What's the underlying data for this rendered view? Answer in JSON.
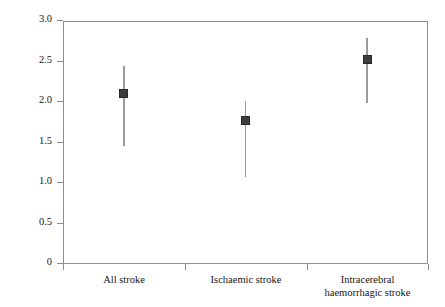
{
  "chart_data": {
    "type": "scatter",
    "title": "",
    "xlabel": "",
    "ylabel": "Odds ratio for smoking (99% CI)",
    "ylim": [
      0,
      3.0
    ],
    "yticks": [
      "0",
      "0.5",
      "1.0",
      "1.5",
      "2.0",
      "2.5",
      "3.0"
    ],
    "ytick_values": [
      0,
      0.5,
      1.0,
      1.5,
      2.0,
      2.5,
      3.0
    ],
    "grid": false,
    "legend": "none",
    "categories": [
      "All stroke",
      "Ischaemic stroke",
      "Intracerebral haemorrhagic stroke"
    ],
    "values": [
      2.11,
      1.77,
      2.53
    ],
    "ci_lower": [
      1.46,
      1.07,
      1.99
    ],
    "ci_upper": [
      2.44,
      2.01,
      2.79
    ],
    "marker_color": "#3d3d3d",
    "errorbar_color": "#9a9a9a",
    "axis_color": "#8e8e8e"
  },
  "axis": {
    "y_title": "Odds ratio for smoking (99% CI)",
    "ticks": [
      {
        "label": "3.0",
        "value": 3.0
      },
      {
        "label": "2.5",
        "value": 2.5
      },
      {
        "label": "2.0",
        "value": 2.0
      },
      {
        "label": "1.5",
        "value": 1.5
      },
      {
        "label": "1.0",
        "value": 1.0
      },
      {
        "label": "0.5",
        "value": 0.5
      },
      {
        "label": "0",
        "value": 0
      }
    ]
  },
  "categories": [
    {
      "line1": "All stroke",
      "line2": ""
    },
    {
      "line1": "Ischaemic stroke",
      "line2": ""
    },
    {
      "line1": "Intracerebral",
      "line2": "haemorrhagic stroke"
    }
  ]
}
